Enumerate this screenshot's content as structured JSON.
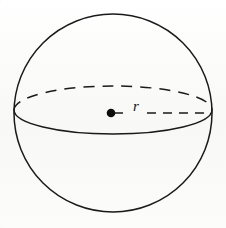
{
  "figure": {
    "name": "sphere-radius-diagram",
    "canvas": {
      "width": 226,
      "height": 228
    },
    "background_color": "#fbfbfa",
    "stroke_color": "#1a1a1a",
    "labels": {
      "radius": "r"
    },
    "geometry": {
      "outline_circle": {
        "cx": 113,
        "cy": 113,
        "r": 99,
        "style": "solid"
      },
      "equator_ellipse": {
        "cx": 113,
        "cy": 110,
        "rx": 99,
        "ry": 24,
        "back_half_style": "dashed",
        "front_half_style": "solid"
      },
      "center_point": {
        "cx": 111,
        "cy": 113,
        "r": 4.3,
        "fill": "#0d0d0d"
      },
      "radius_segment": {
        "from": [
          111,
          113
        ],
        "to": [
          211,
          113
        ],
        "style": "dashed",
        "label_gap": {
          "x": 130,
          "width": 17
        }
      }
    }
  }
}
